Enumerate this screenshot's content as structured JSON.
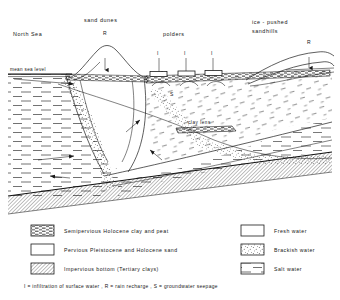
{
  "figure": {
    "title_labels": {
      "north_sea": "North Sea",
      "sand_dunes": "sand dunes",
      "polders": "polders",
      "ice_pushed": "ice - pushed",
      "sandhills": "sandhills"
    },
    "annotations": {
      "mean_sea_level": "mean sea level",
      "clay_lens": "clay lens",
      "recharge_dunes": "R",
      "recharge_sandhills": "R",
      "infiltration_1": "I",
      "infiltration_2": "I",
      "infiltration_3": "I",
      "seepage": "S"
    }
  },
  "legend": {
    "left_items": [
      {
        "pattern": "dash-dense",
        "label": "Semipervious  Holocene  clay  and  peat"
      },
      {
        "pattern": "blank",
        "label": "Pervious Pleistocene  and  Holocene  sand"
      },
      {
        "pattern": "diagonal-hatch",
        "label": "Impervious  bottom  (Tertiary clays)"
      }
    ],
    "right_items": [
      {
        "pattern": "blank",
        "label": "Fresh water"
      },
      {
        "pattern": "stipple",
        "label": "Brackish water"
      },
      {
        "pattern": "dash-horizontal",
        "label": "Salt water"
      }
    ],
    "footnote": "I = infiltration of surface  water ,  R = rain recharge ,  S = groundwater   seepage"
  },
  "colors": {
    "ink": "#1a1a1a",
    "background": "#ffffff"
  }
}
